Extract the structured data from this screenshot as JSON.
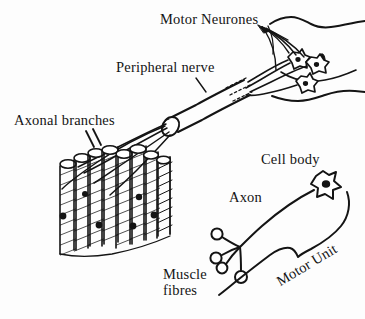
{
  "figure": {
    "background_color": "#fdfdfd",
    "ink_color": "#141414",
    "width": 365,
    "height": 319
  },
  "labels": {
    "motor_neurones": "Motor Neurones",
    "peripheral_nerve": "Peripheral nerve",
    "axonal_branches": "Axonal branches",
    "cell_body": "Cell body",
    "axon": "Axon",
    "muscle_fibres_line1": "Muscle",
    "muscle_fibres_line2": "fibres",
    "motor_unit": "Motor Unit"
  },
  "structures": {
    "spinal_cord": "spinal-cord-cross-section",
    "motor_neurone_somata_count": 3,
    "central_canal": "central-canal-ellipse",
    "nerve_trunk": "peripheral-nerve-trunk",
    "nerve_break": "nerve-break-dashes",
    "muscle_bundle_fibre_count": 9,
    "motor_end_plates_count": 5,
    "inset_terminal_count": 4,
    "inset_soma": "stellate-cell-body",
    "inset_outline": "motor-unit-enclosure",
    "pointer_slashes": "axonal-branches-pointer"
  }
}
